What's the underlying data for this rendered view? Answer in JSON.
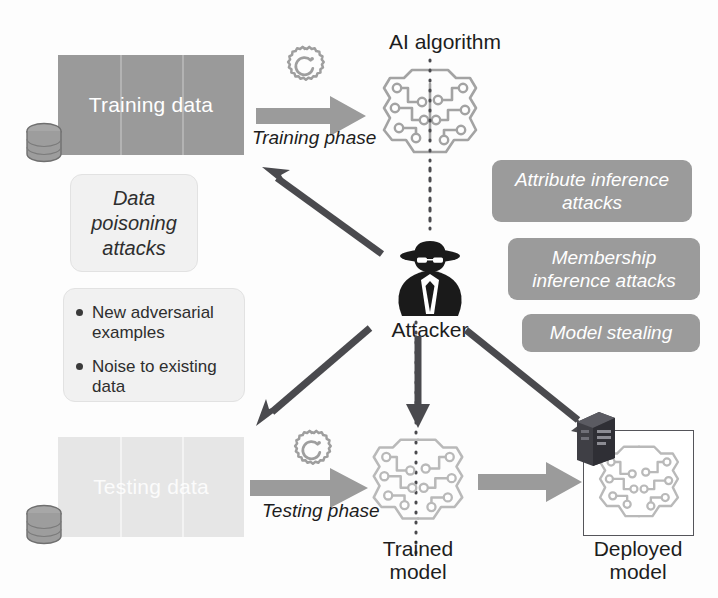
{
  "diagram": {
    "colors": {
      "training_block": "#9a9a9a",
      "testing_block": "#e6e6e6",
      "tag_gray": "#9b9b9b",
      "callout_light": "#f1f1f1",
      "arrow_dark": "#4a4a4e",
      "arrow_gray": "#9b9b9b",
      "attacker_black": "#1a1a1a",
      "text_dark": "#1d1d1d"
    }
  },
  "blocks": {
    "training_data": "Training\ndata",
    "testing_data": "Testing\ndata"
  },
  "phases": {
    "training": "Training phase",
    "testing": "Testing phase"
  },
  "nodes": {
    "ai_algorithm": "AI algorithm",
    "attacker": "Attacker",
    "trained_model": "Trained\nmodel",
    "deployed_model": "Deployed\nmodel"
  },
  "callouts": {
    "data_poisoning": "Data\npoisoning\nattacks",
    "adversarial_bullets": [
      "New adversarial examples",
      "Noise to existing data"
    ]
  },
  "attack_tags": [
    {
      "id": "attribute-inference",
      "label": "Attribute inference attacks"
    },
    {
      "id": "membership-inference",
      "label": "Membership inference attacks"
    },
    {
      "id": "model-stealing",
      "label": "Model stealing"
    }
  ],
  "icons": {
    "database": "database-cylinder-icon",
    "gear": "gear-refresh-icon",
    "brain": "ai-brain-circuit-icon",
    "attacker": "spy-attacker-icon",
    "server": "server-tower-icon"
  }
}
